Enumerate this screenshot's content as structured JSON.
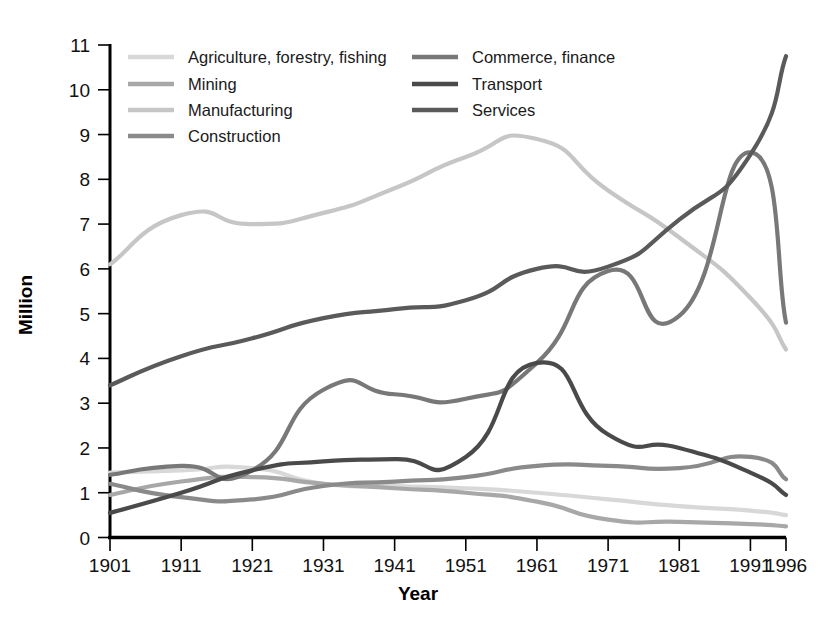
{
  "chart_data": {
    "type": "line",
    "title": "",
    "xlabel": "Year",
    "ylabel": "Million",
    "x": [
      1901,
      1911,
      1921,
      1931,
      1941,
      1951,
      1961,
      1971,
      1981,
      1991,
      1996
    ],
    "xtick_labels": [
      "1901",
      "1911",
      "1921",
      "1931",
      "1941",
      "1951",
      "1961",
      "1971",
      "1981",
      "1991",
      "1996"
    ],
    "ytick_labels": [
      "0",
      "1",
      "2",
      "3",
      "4",
      "5",
      "6",
      "7",
      "8",
      "9",
      "10",
      "11"
    ],
    "xlim": [
      1901,
      1996
    ],
    "ylim": [
      0,
      11
    ],
    "grid": false,
    "legend_position": "top-inside",
    "series": [
      {
        "name": "Agriculture, forestry, fishing",
        "color": "#d8d8d8",
        "values": [
          1.45,
          1.5,
          1.55,
          1.2,
          1.15,
          1.1,
          1.0,
          0.85,
          0.7,
          0.6,
          0.5
        ]
      },
      {
        "name": "Mining",
        "color": "#a8a8a8",
        "values": [
          0.95,
          1.25,
          1.35,
          1.2,
          1.1,
          1.0,
          0.8,
          0.4,
          0.35,
          0.3,
          0.25
        ]
      },
      {
        "name": "Manufacturing",
        "color": "#c6c6c6",
        "values": [
          6.1,
          7.2,
          7.0,
          7.25,
          7.8,
          8.5,
          8.9,
          7.75,
          6.7,
          5.35,
          4.2
        ]
      },
      {
        "name": "Construction",
        "color": "#8a8a8a",
        "values": [
          1.2,
          0.9,
          0.85,
          1.15,
          1.25,
          1.35,
          1.6,
          1.6,
          1.55,
          1.8,
          1.3
        ]
      },
      {
        "name": "Commerce, finance",
        "color": "#787878",
        "values": [
          1.4,
          1.6,
          1.5,
          3.3,
          3.2,
          3.1,
          3.9,
          5.95,
          4.95,
          8.6,
          4.8
        ]
      },
      {
        "name": "Transport",
        "color": "#4a4a4a",
        "values": [
          0.55,
          1.0,
          1.5,
          1.7,
          1.75,
          1.8,
          3.9,
          2.3,
          2.0,
          1.45,
          0.95
        ]
      },
      {
        "name": "Services",
        "color": "#5a5a5a",
        "values": [
          3.4,
          4.05,
          4.45,
          4.9,
          5.1,
          5.3,
          6.0,
          6.05,
          7.1,
          8.55,
          10.75
        ]
      }
    ],
    "legend": [
      {
        "label": "Agriculture, forestry, fishing",
        "color": "#d8d8d8",
        "column": 0,
        "row": 0
      },
      {
        "label": "Mining",
        "color": "#a8a8a8",
        "column": 0,
        "row": 1
      },
      {
        "label": "Manufacturing",
        "color": "#c6c6c6",
        "column": 0,
        "row": 2
      },
      {
        "label": "Construction",
        "color": "#8a8a8a",
        "column": 0,
        "row": 3
      },
      {
        "label": "Commerce, finance",
        "color": "#787878",
        "column": 1,
        "row": 0
      },
      {
        "label": "Transport",
        "color": "#4a4a4a",
        "column": 1,
        "row": 1
      },
      {
        "label": "Services",
        "color": "#5a5a5a",
        "column": 1,
        "row": 2
      }
    ]
  }
}
